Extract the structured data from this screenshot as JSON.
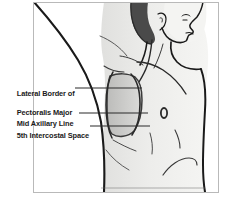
{
  "figure": {
    "frame": {
      "border_color": "#b9b9b9",
      "background_color": "#ffffff"
    },
    "colors": {
      "outline": "#1a1a1a",
      "skin_fill": "#f2f2f0",
      "skin_shadow": "#e3e3e1",
      "hair": "#4a4a4a",
      "safe_zone_fill": "#c9c9c7",
      "safe_zone_outline": "#3a3a3a",
      "leader_line": "#2b2b2b",
      "nipple": "#2a2a2a",
      "label_text": "#1a1a1a"
    },
    "parts": [
      "raised-arm",
      "head-profile",
      "hair",
      "ear",
      "eye",
      "nose",
      "mouth",
      "chin",
      "neck",
      "sternocleidomastoid",
      "clavicle",
      "chest-wall",
      "nipple",
      "ribs",
      "torso"
    ]
  },
  "annotations": {
    "pectoralis": {
      "line1": "Lateral Border of",
      "line2": "Pectoralis Major"
    },
    "mid_axillary": {
      "text": "Mid Axillary Line"
    },
    "intercostal": {
      "text": "5th Intercostal Space"
    }
  },
  "leader_lines": [
    {
      "name": "pectoralis-leader",
      "from_x": 75,
      "to_x": 142,
      "y": 88
    },
    {
      "name": "mid-axillary-leader",
      "from_x": 79,
      "to_x": 148,
      "y": 113
    },
    {
      "name": "intercostal-leader",
      "from_x": 90,
      "to_x": 150,
      "y": 126
    }
  ]
}
